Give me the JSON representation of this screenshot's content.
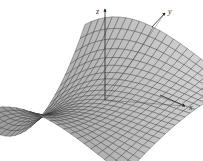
{
  "figure": {
    "type": "3d-surface-wireframe",
    "surface_color": "#b8b8b8",
    "mesh_color": "#2a2a2a",
    "axis_color": "#222222",
    "axes": {
      "x": {
        "label": "x"
      },
      "y": {
        "label": "y"
      },
      "z": {
        "label": "z"
      }
    }
  }
}
